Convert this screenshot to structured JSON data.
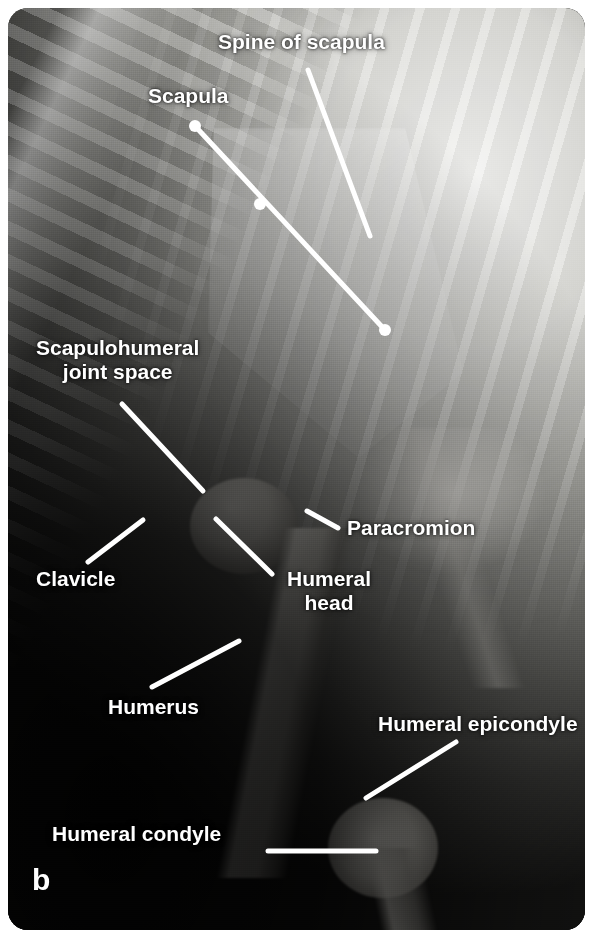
{
  "figure": {
    "panel_label": "b",
    "type": "radiograph",
    "view": "lateral shoulder and forelimb",
    "accent_color": "#ffffff",
    "plate_background": "#050505"
  },
  "annotations": [
    {
      "id": "spine-of-scapula",
      "text": "Spine of scapula",
      "x": 218,
      "y": 30,
      "align": "left",
      "size": 21,
      "leader": {
        "x1": 308,
        "y1": 70,
        "x2": 370,
        "y2": 236,
        "cap_end": false
      }
    },
    {
      "id": "scapula",
      "text": "Scapula",
      "x": 148,
      "y": 84,
      "align": "left",
      "size": 21,
      "leader": {
        "x1": 195,
        "y1": 126,
        "x2": 385,
        "y2": 330,
        "cap_end": true
      }
    },
    {
      "id": "scapulohumeral-joint",
      "text": "Scapulohumeral\njoint space",
      "x": 36,
      "y": 336,
      "align": "center",
      "size": 21,
      "leader": {
        "x1": 122,
        "y1": 404,
        "x2": 203,
        "y2": 491,
        "cap_end": false
      }
    },
    {
      "id": "paracromion",
      "text": "Paracromion",
      "x": 347,
      "y": 516,
      "align": "left",
      "size": 21,
      "leader": {
        "x1": 307,
        "y1": 511,
        "x2": 338,
        "y2": 528,
        "cap_end": false
      }
    },
    {
      "id": "clavicle",
      "text": "Clavicle",
      "x": 36,
      "y": 567,
      "align": "left",
      "size": 21,
      "leader": {
        "x1": 88,
        "y1": 562,
        "x2": 143,
        "y2": 520,
        "cap_end": false
      }
    },
    {
      "id": "humeral-head",
      "text": "Humeral\nhead",
      "x": 287,
      "y": 567,
      "align": "center",
      "size": 21,
      "leader": {
        "x1": 216,
        "y1": 519,
        "x2": 272,
        "y2": 574,
        "cap_end": false
      }
    },
    {
      "id": "humerus",
      "text": "Humerus",
      "x": 108,
      "y": 695,
      "align": "left",
      "size": 21,
      "leader": {
        "x1": 152,
        "y1": 687,
        "x2": 239,
        "y2": 641,
        "cap_end": false
      }
    },
    {
      "id": "humeral-epicondyle",
      "text": "Humeral epicondyle",
      "x": 378,
      "y": 712,
      "align": "left",
      "size": 21,
      "leader": {
        "x1": 366,
        "y1": 798,
        "x2": 456,
        "y2": 742,
        "cap_end": false
      }
    },
    {
      "id": "humeral-condyle",
      "text": "Humeral condyle",
      "x": 52,
      "y": 822,
      "align": "left",
      "size": 21,
      "leader": {
        "x1": 268,
        "y1": 851,
        "x2": 376,
        "y2": 851,
        "cap_end": false
      }
    }
  ]
}
